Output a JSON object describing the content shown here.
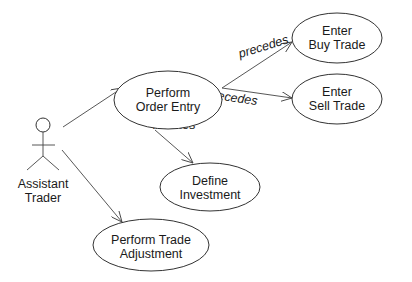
{
  "diagram": {
    "type": "UML use case diagram",
    "actor": {
      "line1": "Assistant",
      "line2": "Trader"
    },
    "use_cases": {
      "order_entry": {
        "line1": "Perform",
        "line2": "Order Entry"
      },
      "buy_trade": {
        "line1": "Enter",
        "line2": "Buy Trade"
      },
      "sell_trade": {
        "line1": "Enter",
        "line2": "Sell Trade"
      },
      "define_investment": {
        "line1": "Define",
        "line2": "Investment"
      },
      "trade_adjustment": {
        "line1": "Perform Trade",
        "line2": "Adjustment"
      }
    },
    "relationships": {
      "precedes_buy": "precedes",
      "precedes_sell": "precedes",
      "invokes": "invokes"
    },
    "colors": {
      "stroke": "#333333",
      "text": "#1a1a1a",
      "background": "#ffffff"
    }
  }
}
